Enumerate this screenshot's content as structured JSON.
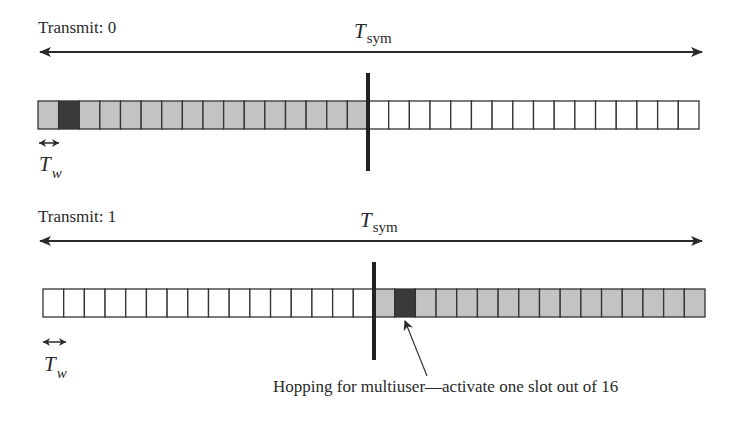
{
  "diagram": {
    "colors": {
      "active": "#c3c3c3",
      "selected": "#3a3a3a",
      "inactive": "#ffffff",
      "stroke": "#333333"
    },
    "rows": [
      {
        "label": "Transmit: 0",
        "period_symbol": "T",
        "period_subscript": "sym",
        "slot_symbol": "T",
        "slot_subscript": "w",
        "left_half": {
          "state": "active",
          "slots": 16,
          "selected_slot_index": 1
        },
        "right_half": {
          "state": "inactive",
          "slots": 16
        }
      },
      {
        "label": "Transmit: 1",
        "period_symbol": "T",
        "period_subscript": "sym",
        "slot_symbol": "T",
        "slot_subscript": "w",
        "left_half": {
          "state": "inactive",
          "slots": 16
        },
        "right_half": {
          "state": "active",
          "slots": 16,
          "selected_slot_index": 1
        }
      }
    ],
    "annotation": "Hopping for multiuser—activate one slot out of 16"
  }
}
